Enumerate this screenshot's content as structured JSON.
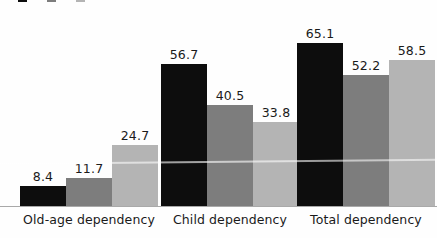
{
  "chart_data": {
    "type": "bar",
    "title": "",
    "subtitle": "",
    "xlabel": "",
    "ylabel": "",
    "ylim": [
      0,
      65.1
    ],
    "grid": false,
    "legend_position": "top-left",
    "legend_clipped": true,
    "categories": [
      "Old-age dependency",
      "Child dependency",
      "Total dependency"
    ],
    "series": [
      {
        "name": "series-1",
        "color": "#0d0d0d",
        "values": [
          8.4,
          56.7,
          65.1
        ],
        "labels": [
          "8.4",
          "56.7",
          "65.1"
        ]
      },
      {
        "name": "series-2",
        "color": "#7d7d7d",
        "values": [
          11.7,
          40.5,
          52.2
        ],
        "labels": [
          "11.7",
          "40.5",
          "52.2"
        ]
      },
      {
        "name": "series-3",
        "color": "#b4b4b4",
        "values": [
          24.7,
          33.8,
          58.5
        ],
        "labels": [
          "24.7",
          "33.8",
          "58.5"
        ]
      }
    ]
  },
  "legend": {
    "items": [
      {
        "label": "",
        "color": "#0d0d0d",
        "swatch_name": "legend-swatch-series-1"
      },
      {
        "label": "",
        "color": "#7d7d7d",
        "swatch_name": "legend-swatch-series-2"
      },
      {
        "label": "",
        "color": "#b4b4b4",
        "swatch_name": "legend-swatch-series-3"
      }
    ]
  },
  "axis": {
    "baseline_color": "#a9a9a9"
  },
  "colors": {
    "background": "#fefefe",
    "series_1": "#0d0d0d",
    "series_2": "#7d7d7d",
    "series_3": "#b4b4b4",
    "text": "#1a1a1a",
    "axis": "#a9a9a9"
  }
}
